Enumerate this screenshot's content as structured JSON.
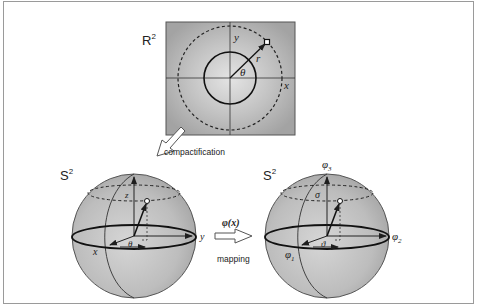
{
  "planar": {
    "space_label": "R",
    "space_sup": "2",
    "axis_x": "x",
    "axis_y": "y",
    "radius_label": "r",
    "angle_label": "θ"
  },
  "compactification": {
    "label": "compactification"
  },
  "sphere_left": {
    "space_label": "S",
    "space_sup": "2",
    "axis_x": "x",
    "axis_y": "y",
    "axis_z": "z",
    "angle_label": "θ"
  },
  "mapping": {
    "function_label": "φ(x)",
    "label": "mapping"
  },
  "sphere_right": {
    "space_label": "S",
    "space_sup": "2",
    "axis_1": "φ",
    "axis_1_sub": "1",
    "axis_2": "φ",
    "axis_2_sub": "2",
    "axis_3": "φ",
    "axis_3_sub": "3",
    "polar_label": "σ",
    "angle_label": "ϑ"
  },
  "colors": {
    "plane_fill": "#a9a9a9",
    "sphere_fill": "#b8b8b8",
    "line": "#1e1e1e",
    "border": "#9a9a9a"
  }
}
